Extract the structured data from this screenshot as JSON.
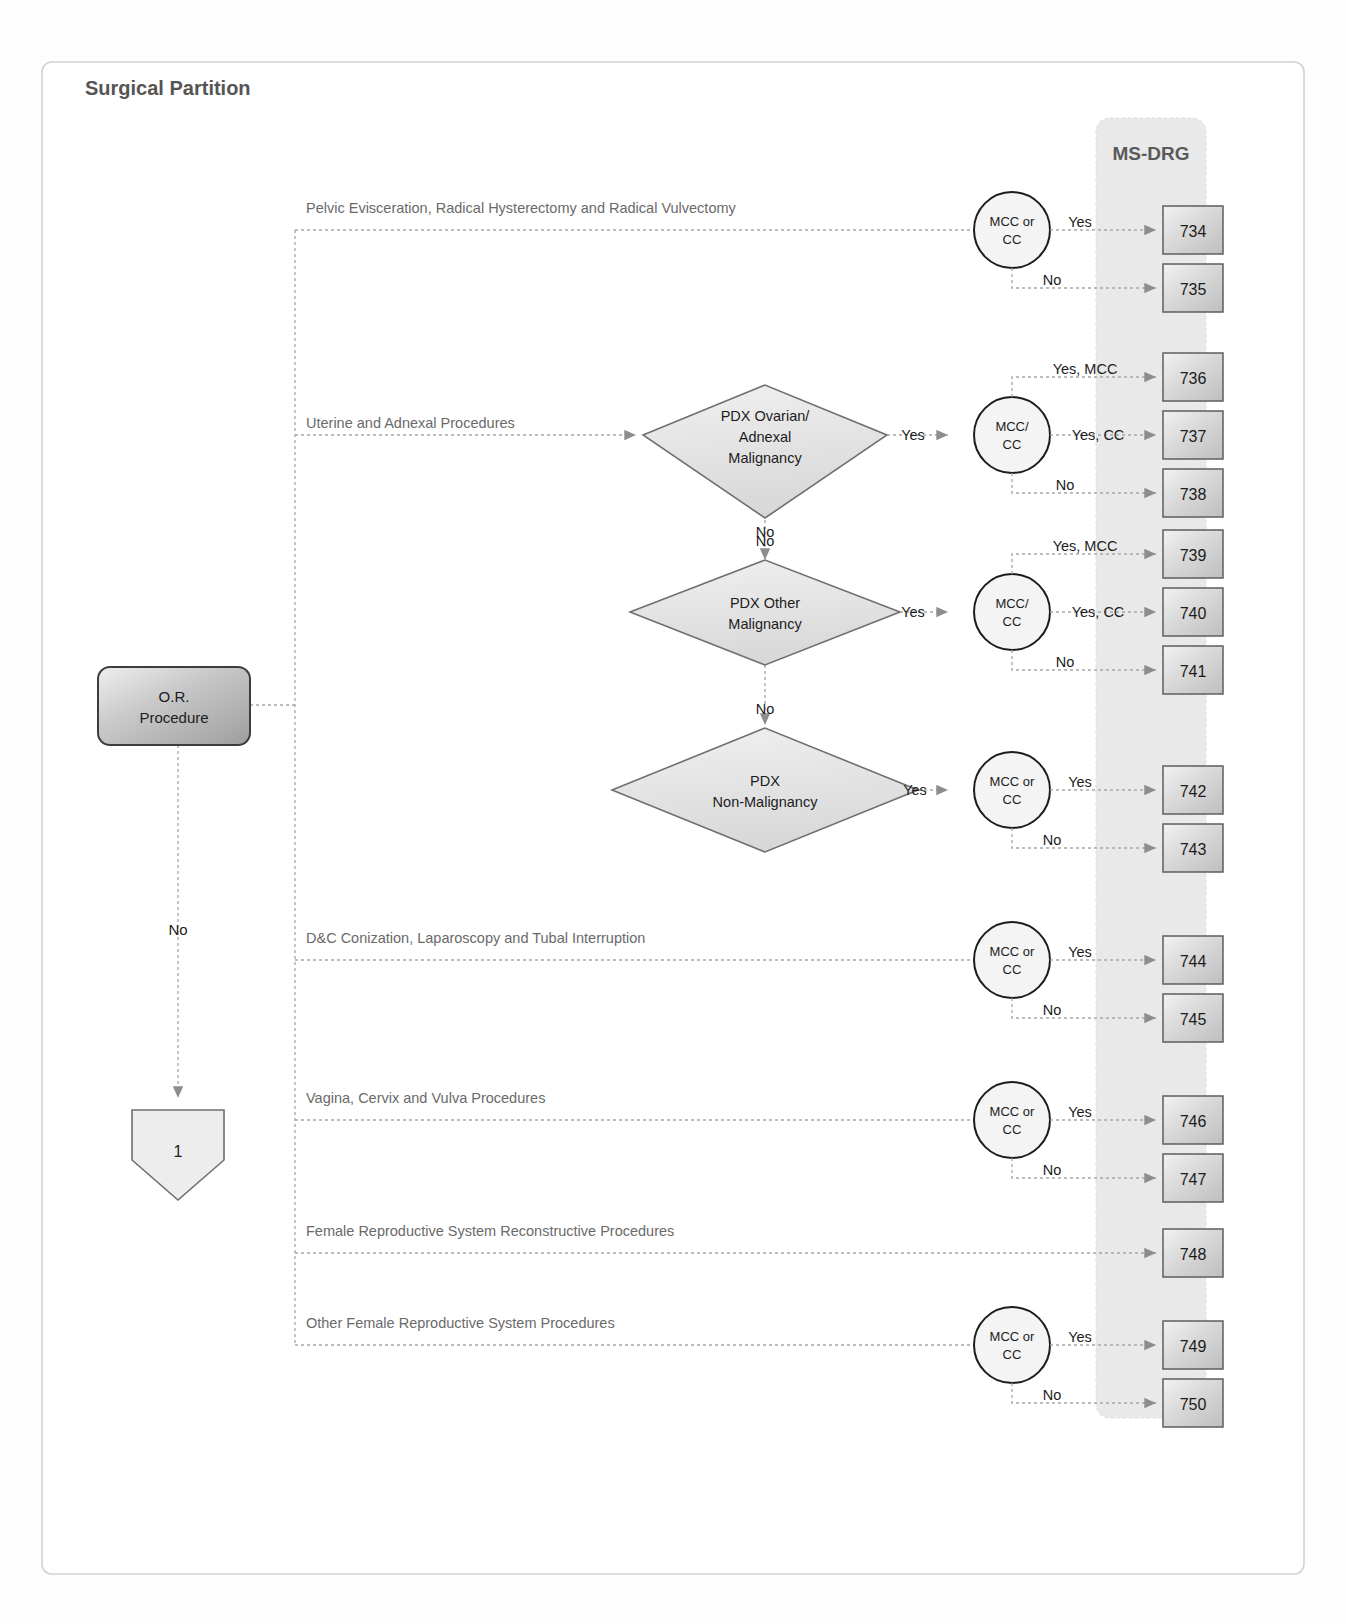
{
  "page": {
    "title": "Surgical Partition",
    "drg_column_header": "MS-DRG"
  },
  "colors": {
    "text": "#4a4a4a",
    "dark_text": "#1c1c1c",
    "line": "#9a9a9a",
    "shape_stroke": "#7a7a7a",
    "band_fill": "#e8e8e8",
    "shape_fill": "#ededed",
    "box_fill": "#d6d6d6",
    "frame": "#cfcfcf"
  },
  "entry": {
    "label_line1": "O.R.",
    "label_line2": "Procedure",
    "no_label": "No",
    "connector_label": "1"
  },
  "branches": [
    {
      "id": "pelvic",
      "label": "Pelvic Evisceration, Radical Hysterectomy and Radical Vulvectomy",
      "decision": null,
      "gate": {
        "line1": "MCC or",
        "line2": "CC"
      },
      "outcomes": [
        {
          "edge": "Yes",
          "drg": "734"
        },
        {
          "edge": "No",
          "drg": "735"
        }
      ]
    },
    {
      "id": "uterine",
      "label": "Uterine and Adnexal Procedures",
      "decision": {
        "line1": "PDX Ovarian/",
        "line2": "Adnexal",
        "line3": "Malignancy",
        "yes_label": "Yes",
        "no_label": "No"
      },
      "gate": {
        "line1": "MCC/",
        "line2": "CC"
      },
      "outcomes": [
        {
          "edge": "Yes, MCC",
          "drg": "736"
        },
        {
          "edge": "Yes, CC",
          "drg": "737"
        },
        {
          "edge": "No",
          "drg": "738"
        }
      ]
    },
    {
      "id": "other-malignancy",
      "label": "",
      "decision": {
        "line1": "PDX Other",
        "line2": "Malignancy",
        "line3": "",
        "yes_label": "Yes",
        "no_label": "No"
      },
      "gate": {
        "line1": "MCC/",
        "line2": "CC"
      },
      "outcomes": [
        {
          "edge": "Yes, MCC",
          "drg": "739"
        },
        {
          "edge": "Yes, CC",
          "drg": "740"
        },
        {
          "edge": "No",
          "drg": "741"
        }
      ]
    },
    {
      "id": "non-malignancy",
      "label": "",
      "decision": {
        "line1": "PDX",
        "line2": "Non-Malignancy",
        "line3": "",
        "yes_label": "Yes",
        "no_label": ""
      },
      "gate": {
        "line1": "MCC or",
        "line2": "CC"
      },
      "outcomes": [
        {
          "edge": "Yes",
          "drg": "742"
        },
        {
          "edge": "No",
          "drg": "743"
        }
      ]
    },
    {
      "id": "dc-conization",
      "label": "D&C Conization, Laparoscopy and Tubal Interruption",
      "decision": null,
      "gate": {
        "line1": "MCC or",
        "line2": "CC"
      },
      "outcomes": [
        {
          "edge": "Yes",
          "drg": "744"
        },
        {
          "edge": "No",
          "drg": "745"
        }
      ]
    },
    {
      "id": "vagina-cervix-vulva",
      "label": "Vagina, Cervix and Vulva Procedures",
      "decision": null,
      "gate": {
        "line1": "MCC or",
        "line2": "CC"
      },
      "outcomes": [
        {
          "edge": "Yes",
          "drg": "746"
        },
        {
          "edge": "No",
          "drg": "747"
        }
      ]
    },
    {
      "id": "reconstructive",
      "label": "Female Reproductive System Reconstructive Procedures",
      "decision": null,
      "gate": null,
      "outcomes": [
        {
          "edge": "",
          "drg": "748"
        }
      ]
    },
    {
      "id": "other-female",
      "label": "Other Female Reproductive System Procedures",
      "decision": null,
      "gate": {
        "line1": "MCC or",
        "line2": "CC"
      },
      "outcomes": [
        {
          "edge": "Yes",
          "drg": "749"
        },
        {
          "edge": "No",
          "drg": "750"
        }
      ]
    }
  ],
  "drg_boxes": [
    "734",
    "735",
    "736",
    "737",
    "738",
    "739",
    "740",
    "741",
    "742",
    "743",
    "744",
    "745",
    "746",
    "747",
    "748",
    "749",
    "750"
  ]
}
